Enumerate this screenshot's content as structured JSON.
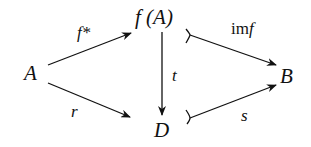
{
  "diagram": {
    "type": "commutative-diagram",
    "nodes": {
      "A": "A",
      "fA": "f (A)",
      "B": "B",
      "D": "D"
    },
    "edges": [
      {
        "from": "A",
        "to": "f(A)",
        "label": "f*",
        "style": "arrow"
      },
      {
        "from": "A",
        "to": "D",
        "label": "r",
        "style": "arrow"
      },
      {
        "from": "f(A)",
        "to": "D",
        "label": "t",
        "style": "arrow"
      },
      {
        "from": "f(A)",
        "to": "B",
        "label": "imf",
        "style": "mono-arrow"
      },
      {
        "from": "D",
        "to": "B",
        "label": "s",
        "style": "mono-arrow"
      }
    ],
    "labels": {
      "f_star": "f*",
      "r": "r",
      "t": "t",
      "im": "im",
      "im_f": "f",
      "s": "s"
    },
    "colors": {
      "ink": "#111111",
      "background": "#ffffff"
    }
  }
}
